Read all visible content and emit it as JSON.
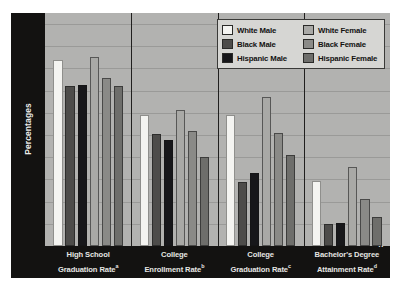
{
  "chart_data": {
    "type": "bar",
    "title": "",
    "xlabel": "",
    "ylabel": "Percentages",
    "ylim": [
      0,
      105
    ],
    "ytick_labels": [
      "100",
      "90",
      "80",
      "70",
      "60",
      "50",
      "40",
      "30",
      "20",
      "10",
      "0"
    ],
    "ytick_values": [
      100,
      90,
      80,
      70,
      60,
      50,
      40,
      30,
      20,
      10,
      0
    ],
    "grid": true,
    "legend_position": "top-right",
    "categories": [
      "High School Graduation Rate",
      "College Enrollment Rate",
      "College Graduation Rate",
      "Bachelor's Degree Attainment Rate"
    ],
    "category_footnotes": [
      "a",
      "b",
      "c",
      "d"
    ],
    "category_lines": [
      [
        "High School",
        "Graduation Rate"
      ],
      [
        "College",
        "Enrollment Rate"
      ],
      [
        "College",
        "Graduation Rate"
      ],
      [
        "Bachelor's Degree",
        "Attainment Rate"
      ]
    ],
    "series": [
      {
        "name": "White Male",
        "color": "#f4f4f1",
        "values": [
          84,
          59,
          59,
          29.5
        ]
      },
      {
        "name": "Black Male",
        "color": "#4d4c4a",
        "values": [
          72,
          50.5,
          29,
          10
        ]
      },
      {
        "name": "Hispanic Male",
        "color": "#17171a",
        "values": [
          72.5,
          48,
          33,
          10.5
        ]
      },
      {
        "name": "White Female",
        "color": "#a9a9a6",
        "values": [
          85,
          61.5,
          67,
          35.5
        ]
      },
      {
        "name": "Black Female",
        "color": "#8a8a87",
        "values": [
          75.5,
          52,
          51,
          21
        ]
      },
      {
        "name": "Hispanic Female",
        "color": "#6e6e6b",
        "values": [
          72,
          40,
          41,
          13
        ]
      }
    ]
  },
  "legend": {
    "items": [
      {
        "label": "White Male",
        "color": "#f4f4f1"
      },
      {
        "label": "White Female",
        "color": "#a9a9a6"
      },
      {
        "label": "Black Male",
        "color": "#4d4c4a"
      },
      {
        "label": "Black Female",
        "color": "#8a8a87"
      },
      {
        "label": "Hispanic Male",
        "color": "#17171a"
      },
      {
        "label": "Hispanic Female",
        "color": "#6e6e6b"
      }
    ]
  },
  "colors": {
    "plot_background": "#b2b2b0",
    "axis_panel": "#131211",
    "gridline": "#9a9a98",
    "separator": "#201f1e",
    "axis_text": "#ededea"
  }
}
